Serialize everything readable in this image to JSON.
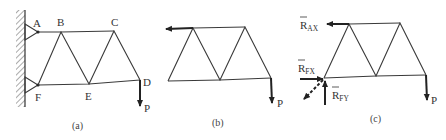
{
  "figure": {
    "panels": [
      {
        "id": "a",
        "caption": "(a)",
        "nodes": {
          "A": "A",
          "B": "B",
          "C": "C",
          "D": "D",
          "E": "E",
          "F": "F"
        },
        "load_label": "P",
        "support": "fixed wall with pin supports at A and F"
      },
      {
        "id": "b",
        "caption": "(b)",
        "load_label": "P"
      },
      {
        "id": "c",
        "caption": "(c)",
        "load_label": "P",
        "reactions": {
          "rax": {
            "main": "R",
            "sub": "AX"
          },
          "rfx": {
            "main": "R",
            "sub": "FX"
          },
          "rfy": {
            "main": "R",
            "sub": "FY"
          }
        }
      }
    ]
  },
  "colors": {
    "line": "#3a3a3a",
    "force": "#222222",
    "text": "#333333",
    "background": "#ffffff"
  }
}
